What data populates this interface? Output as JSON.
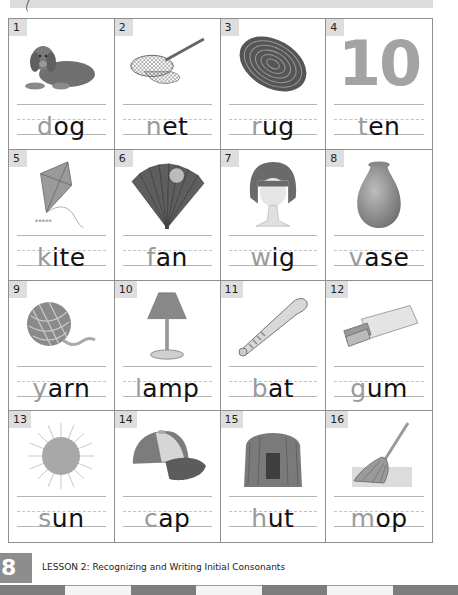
{
  "header": {
    "banner_icon": "swoosh-icon"
  },
  "cards": [
    {
      "number": "1",
      "first_letter": "d",
      "rest": "og",
      "picture": "dog-icon"
    },
    {
      "number": "2",
      "first_letter": "n",
      "rest": "et",
      "picture": "net-icon"
    },
    {
      "number": "3",
      "first_letter": "r",
      "rest": "ug",
      "picture": "rug-icon"
    },
    {
      "number": "4",
      "first_letter": "t",
      "rest": "en",
      "picture": "ten-icon",
      "picture_text": "10"
    },
    {
      "number": "5",
      "first_letter": "k",
      "rest": "ite",
      "picture": "kite-icon"
    },
    {
      "number": "6",
      "first_letter": "f",
      "rest": "an",
      "picture": "fan-icon"
    },
    {
      "number": "7",
      "first_letter": "w",
      "rest": "ig",
      "picture": "wig-icon"
    },
    {
      "number": "8",
      "first_letter": "v",
      "rest": "ase",
      "picture": "vase-icon"
    },
    {
      "number": "9",
      "first_letter": "y",
      "rest": "arn",
      "picture": "yarn-icon"
    },
    {
      "number": "10",
      "first_letter": "l",
      "rest": "amp",
      "picture": "lamp-icon"
    },
    {
      "number": "11",
      "first_letter": "b",
      "rest": "at",
      "picture": "bat-icon"
    },
    {
      "number": "12",
      "first_letter": "g",
      "rest": "um",
      "picture": "gum-icon"
    },
    {
      "number": "13",
      "first_letter": "s",
      "rest": "un",
      "picture": "sun-icon"
    },
    {
      "number": "14",
      "first_letter": "c",
      "rest": "ap",
      "picture": "cap-icon"
    },
    {
      "number": "15",
      "first_letter": "h",
      "rest": "ut",
      "picture": "hut-icon"
    },
    {
      "number": "16",
      "first_letter": "m",
      "rest": "op",
      "picture": "mop-icon"
    }
  ],
  "footer": {
    "page_number": "8",
    "lesson_caption": "LESSON 2:  Recognizing and Writing Initial Consonants"
  },
  "colors": {
    "traced_letter": "#9a9a9a",
    "printed_letters": "#111111",
    "grid_border": "#8f8f8f",
    "number_badge": "#dedede",
    "page_tab": "#8d8d8d"
  }
}
